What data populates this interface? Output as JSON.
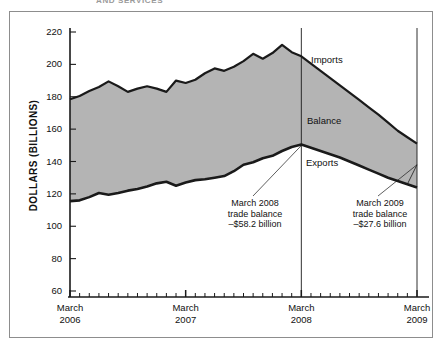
{
  "figure": {
    "clipped_caption": "AND SERVICES",
    "ylabel": "DOLLARS (BILLIONS)"
  },
  "series_labels": {
    "imports": "Imports",
    "balance": "Balance",
    "exports": "Exports"
  },
  "annotations": [
    {
      "line1": "March 2008",
      "line2": "trade balance",
      "line3": "–$58.2 billion"
    },
    {
      "line1": "March 2009",
      "line2": "trade balance",
      "line3": "–$27.6 billion"
    }
  ],
  "axis": {
    "y_ticks": [
      "220",
      "200",
      "180",
      "160",
      "140",
      "120",
      "100",
      "80",
      "60"
    ],
    "x_ticks": [
      {
        "month": "March",
        "year": "2006"
      },
      {
        "month": "March",
        "year": "2007"
      },
      {
        "month": "March",
        "year": "2008"
      },
      {
        "month": "March",
        "year": "2009"
      }
    ]
  },
  "colors": {
    "fill": "#b4b4b4",
    "line": "#1a1a1a",
    "frame": "#8d8d8d",
    "background": "#ffffff"
  },
  "chart_data": {
    "type": "area",
    "title": "",
    "subtitle": "",
    "xlabel": "",
    "ylabel": "DOLLARS (BILLIONS)",
    "ylim": [
      50,
      228
    ],
    "xlim": [
      0,
      37
    ],
    "grid": false,
    "legend": "inline-annotations",
    "x_major_ticks": [
      "March 2006",
      "March 2007",
      "March 2008",
      "March 2009"
    ],
    "x_major_indices": [
      0,
      12,
      24,
      36
    ],
    "x_minor_tick_interval_months": 1,
    "vertical_reference_lines": [
      24,
      36
    ],
    "shaded_region": "between imports and exports (trade balance)",
    "series": [
      {
        "name": "Imports",
        "values": [
          178.5,
          180.5,
          183.5,
          186.0,
          189.5,
          186.5,
          183.0,
          185.0,
          186.5,
          185.0,
          183.0,
          190.0,
          188.5,
          190.5,
          194.5,
          197.5,
          196.0,
          198.5,
          202.0,
          206.5,
          203.5,
          207.0,
          212.0,
          207.5,
          205.0,
          200.5,
          196.0,
          191.5,
          187.0,
          182.5,
          178.0,
          173.5,
          169.0,
          164.0,
          159.0,
          155.0,
          151.0
        ]
      },
      {
        "name": "Exports",
        "values": [
          115.5,
          116.0,
          118.0,
          120.5,
          119.5,
          120.5,
          122.0,
          123.0,
          124.5,
          126.5,
          127.5,
          125.0,
          127.0,
          128.5,
          129.0,
          130.0,
          131.0,
          134.0,
          138.0,
          139.5,
          142.0,
          143.5,
          146.5,
          149.0,
          150.5,
          148.5,
          146.5,
          144.5,
          142.5,
          140.0,
          137.5,
          135.0,
          132.5,
          130.0,
          128.0,
          126.0,
          124.0
        ]
      }
    ],
    "callout_points": [
      {
        "label": "March 2008 trade balance",
        "x_index": 24,
        "imports": 205.0,
        "exports": 150.5,
        "balance": -58.2
      },
      {
        "label": "March 2009 trade balance",
        "x_index": 36,
        "imports": 151.0,
        "exports": 124.0,
        "balance": -27.6
      }
    ]
  }
}
